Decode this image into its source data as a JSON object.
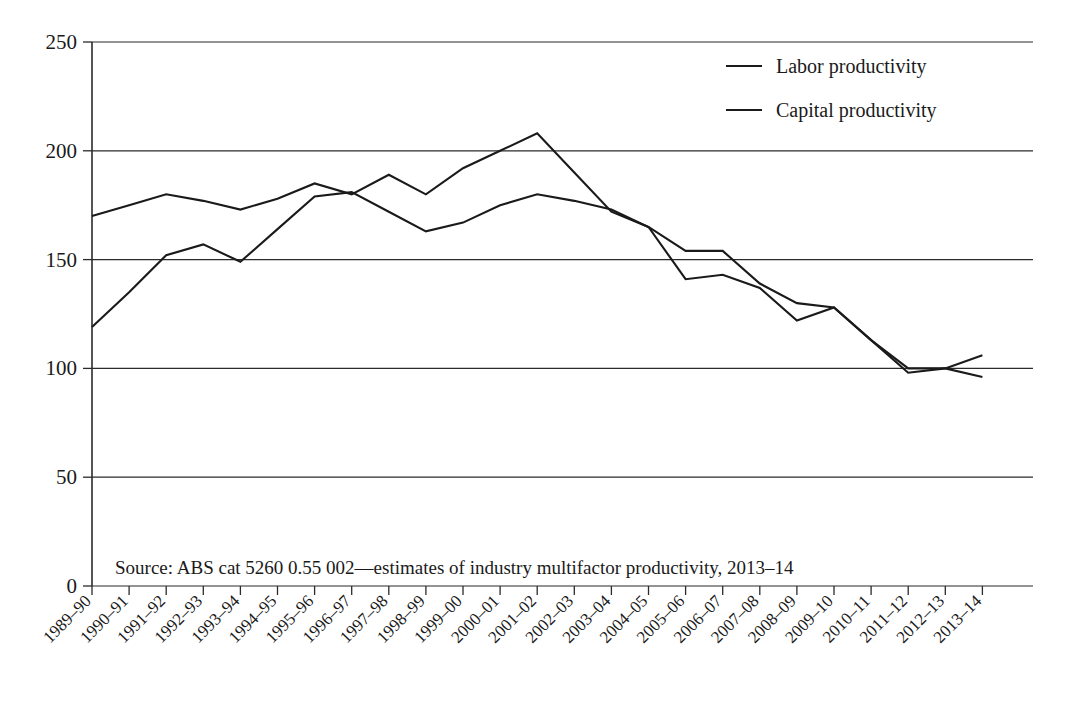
{
  "chart_data": {
    "type": "line",
    "title": "",
    "xlabel": "",
    "ylabel": "",
    "ylim": [
      0,
      250
    ],
    "yticks": [
      0,
      50,
      100,
      150,
      200,
      250
    ],
    "grid": true,
    "legend_position": "top-right",
    "categories": [
      "1989–90",
      "1990–91",
      "1991–92",
      "1992–93",
      "1993–94",
      "1994–95",
      "1995–96",
      "1996–97",
      "1997–98",
      "1998–99",
      "1999–00",
      "2000–01",
      "2001–02",
      "2002–03",
      "2003–04",
      "2004–05",
      "2005–06",
      "2006–07",
      "2007–08",
      "2008–09",
      "2009–10",
      "2010–11",
      "2011–12",
      "2012–13",
      "2013–14"
    ],
    "series": [
      {
        "name": "Labor productivity",
        "values": [
          170,
          175,
          180,
          177,
          173,
          178,
          185,
          180,
          189,
          180,
          192,
          200,
          208,
          190,
          172,
          165,
          154,
          154,
          139,
          130,
          128,
          113,
          98,
          100,
          106
        ]
      },
      {
        "name": "Capital productivity",
        "values": [
          119,
          135,
          152,
          157,
          149,
          164,
          179,
          181,
          172,
          163,
          167,
          175,
          180,
          177,
          173,
          165,
          141,
          143,
          137,
          122,
          128,
          113,
          100,
          100,
          96
        ]
      }
    ],
    "annotations": [
      "Source: ABS cat 5260 0.55 002—estimates of industry multifactor productivity, 2013–14"
    ]
  },
  "legend": {
    "items": [
      {
        "label": "Labor productivity"
      },
      {
        "label": "Capital productivity"
      }
    ]
  },
  "source_note": {
    "text": "Source: ABS cat 5260 0.55 002—estimates of industry multifactor productivity, 2013–14"
  },
  "y_axis": {
    "ticks": [
      "0",
      "50",
      "100",
      "150",
      "200",
      "250"
    ]
  },
  "x_axis": {
    "ticks": [
      "1989–90",
      "1990–91",
      "1991–92",
      "1992–93",
      "1993–94",
      "1994–95",
      "1995–96",
      "1996–97",
      "1997–98",
      "1998–99",
      "1999–00",
      "2000–01",
      "2001–02",
      "2002–03",
      "2003–04",
      "2004–05",
      "2005–06",
      "2006–07",
      "2007–08",
      "2008–09",
      "2009–10",
      "2010–11",
      "2011–12",
      "2012–13",
      "2013–14"
    ]
  },
  "colors": {
    "ink": "#1a1a1a",
    "grid": "#2b2b2b",
    "background": "#ffffff"
  }
}
